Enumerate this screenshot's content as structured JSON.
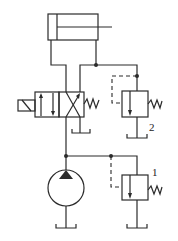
{
  "diagram": {
    "type": "hydraulic-circuit",
    "components": [
      {
        "id": "cylinder",
        "kind": "single-rod double-acting cylinder"
      },
      {
        "id": "directional-valve",
        "kind": "4/2 solenoid-operated directional valve, spring return"
      },
      {
        "id": "pump",
        "kind": "fixed-displacement hydraulic pump"
      },
      {
        "id": "relief-valve-1",
        "kind": "pressure relief valve",
        "label": "1"
      },
      {
        "id": "relief-valve-2",
        "kind": "pressure relief valve",
        "label": "2"
      }
    ],
    "labels": {
      "valve1": "1",
      "valve2": "2"
    },
    "colors": {
      "line": "#2b2b2b",
      "background": "#ffffff"
    }
  }
}
